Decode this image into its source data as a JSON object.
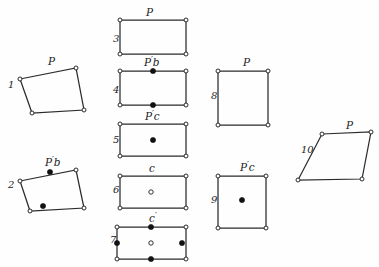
{
  "figure": {
    "background_color": "#fefefe",
    "stroke_color": "#2b2b2b",
    "point_fill_color": "#111111",
    "point_open_color": "#ffffff",
    "width": 379,
    "height": 267
  },
  "cells": [
    {
      "index": "1",
      "label": "P",
      "shape": "parallelogram",
      "index_x": 8,
      "index_y": 88,
      "label_x": 48,
      "label_y": 65,
      "points": "20,79 76,68 84,110 32,113",
      "vertices": [
        [
          20,
          79
        ],
        [
          76,
          68
        ],
        [
          84,
          110
        ],
        [
          32,
          113
        ]
      ],
      "markers": []
    },
    {
      "index": "2",
      "label": "P'b",
      "shape": "parallelogram",
      "index_x": 8,
      "index_y": 188,
      "label_x": 45,
      "label_y": 166,
      "points": "20,181 76,170 84,208 30,211",
      "vertices": [
        [
          20,
          181
        ],
        [
          76,
          170
        ],
        [
          84,
          208
        ],
        [
          30,
          211
        ]
      ],
      "markers": [
        {
          "type": "filled",
          "x": 50,
          "y": 172
        },
        {
          "type": "filled",
          "x": 43,
          "y": 206
        }
      ]
    },
    {
      "index": "3",
      "label": "P",
      "shape": "rectangle",
      "index_x": 113,
      "index_y": 42,
      "label_x": 146,
      "label_y": 16,
      "points": "120,20 186,20 186,54 120,54",
      "vertices": [
        [
          120,
          20
        ],
        [
          186,
          20
        ],
        [
          186,
          54
        ],
        [
          120,
          54
        ]
      ],
      "markers": []
    },
    {
      "index": "4",
      "label": "P'b",
      "shape": "rectangle",
      "index_x": 113,
      "index_y": 93,
      "label_x": 144,
      "label_y": 66,
      "points": "120,71 186,71 186,105 120,105",
      "vertices": [
        [
          120,
          71
        ],
        [
          186,
          71
        ],
        [
          186,
          105
        ],
        [
          120,
          105
        ]
      ],
      "markers": [
        {
          "type": "filled",
          "x": 153,
          "y": 71
        },
        {
          "type": "filled",
          "x": 153,
          "y": 105
        }
      ]
    },
    {
      "index": "5",
      "label": "P'c",
      "shape": "rectangle",
      "index_x": 113,
      "index_y": 143,
      "label_x": 145,
      "label_y": 120,
      "points": "120,124 186,124 186,156 120,156",
      "vertices": [
        [
          120,
          124
        ],
        [
          186,
          124
        ],
        [
          186,
          156
        ],
        [
          120,
          156
        ]
      ],
      "markers": [
        {
          "type": "filled",
          "x": 153,
          "y": 140
        }
      ]
    },
    {
      "index": "6",
      "label": "c",
      "shape": "rectangle",
      "index_x": 113,
      "index_y": 193,
      "label_x": 149,
      "label_y": 172,
      "points": "120,176 186,176 186,208 120,208",
      "vertices": [
        [
          120,
          176
        ],
        [
          186,
          176
        ],
        [
          186,
          208
        ],
        [
          120,
          208
        ]
      ],
      "markers": [
        {
          "type": "open",
          "x": 151,
          "y": 192
        }
      ]
    },
    {
      "index": "7",
      "label": "c'",
      "shape": "rectangle",
      "index_x": 110,
      "index_y": 243,
      "label_x": 149,
      "label_y": 222,
      "points": "117,227 186,227 186,259 117,259",
      "vertices": [
        [
          117,
          227
        ],
        [
          186,
          227
        ],
        [
          186,
          259
        ],
        [
          117,
          259
        ]
      ],
      "markers": [
        {
          "type": "filled",
          "x": 151,
          "y": 227
        },
        {
          "type": "filled",
          "x": 151,
          "y": 259
        },
        {
          "type": "filled",
          "x": 117,
          "y": 243
        },
        {
          "type": "filled",
          "x": 182,
          "y": 243
        },
        {
          "type": "open",
          "x": 151,
          "y": 243
        }
      ]
    },
    {
      "index": "8",
      "label": "P",
      "shape": "square",
      "index_x": 211,
      "index_y": 99,
      "label_x": 243,
      "label_y": 66,
      "points": "218,71 268,71 268,125 218,125",
      "vertices": [
        [
          218,
          71
        ],
        [
          268,
          71
        ],
        [
          268,
          125
        ],
        [
          218,
          125
        ]
      ],
      "markers": []
    },
    {
      "index": "9",
      "label": "P'c",
      "shape": "square",
      "index_x": 211,
      "index_y": 203,
      "label_x": 240,
      "label_y": 171,
      "points": "218,176 266,176 266,228 218,228",
      "vertices": [
        [
          218,
          176
        ],
        [
          266,
          176
        ],
        [
          266,
          228
        ],
        [
          218,
          228
        ]
      ],
      "markers": [
        {
          "type": "filled",
          "x": 242,
          "y": 200
        }
      ]
    },
    {
      "index": "10",
      "label": "P",
      "shape": "parallelogram",
      "index_x": 301,
      "index_y": 153,
      "label_x": 346,
      "label_y": 129,
      "points": "322,134 371,132 362,179 298,180",
      "vertices": [
        [
          322,
          134
        ],
        [
          371,
          132
        ],
        [
          362,
          179
        ],
        [
          298,
          180
        ]
      ],
      "markers": []
    }
  ]
}
